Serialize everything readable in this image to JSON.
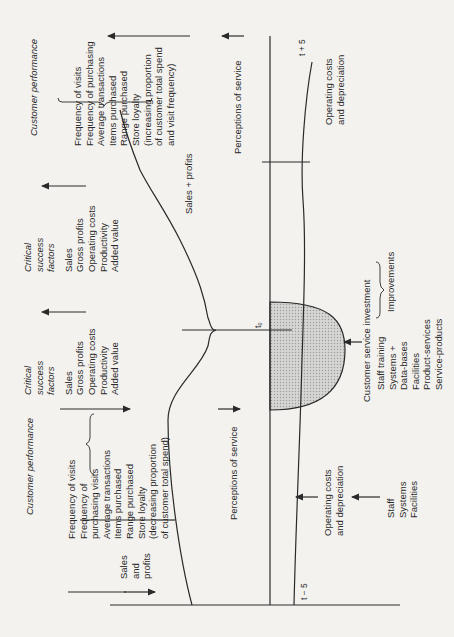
{
  "diagram": {
    "orientation": "rotated-90-ccw",
    "colors": {
      "ink": "#2a2a2a",
      "paper": "#f3f2ee",
      "shade": "#c9c9c9"
    },
    "left_customer_performance": {
      "heading": "Customer performance",
      "items": [
        "Frequency of visits",
        "Frequency of",
        "purchasing visits",
        "Average transactions",
        "Items purchased",
        "Range purchased",
        "Store loyalty",
        "(decreasing proportion",
        "of customer total spend)"
      ],
      "brace_label": [
        "Sales",
        "and",
        "profits"
      ]
    },
    "left_critical_success": {
      "heading": [
        "Critical",
        "success",
        "factors"
      ],
      "items": [
        "Sales",
        "Gross profits",
        "Operating costs",
        "Productivity",
        "Added value"
      ]
    },
    "right_critical_success": {
      "heading": [
        "Critical",
        "success",
        "factors"
      ],
      "items": [
        "Sales",
        "Gross profits",
        "Operating costs",
        "Productivity",
        "Added value"
      ]
    },
    "right_customer_performance": {
      "heading": "Customer performance",
      "items": [
        "Frequency of visits",
        "Frequency of purchasing",
        "Average transactions",
        "Items purchased",
        "Range purchased",
        "Store loyalty",
        "(increasing proportion",
        "of customer total spend",
        "and visit frequency)"
      ]
    },
    "sales_profits_label": "Sales + profits",
    "perceptions_left": "Perceptions of service",
    "perceptions_right": "Perceptions of service",
    "t0_label": "t₀",
    "t_minus_label": "t − 5",
    "t_plus_label": "t + 5",
    "operating_costs_left": [
      "Operating costs",
      "and depreciation"
    ],
    "operating_costs_right": [
      "Operating costs",
      "and depreciation"
    ],
    "staff_systems": [
      "Staff",
      "Systems",
      "Facilities"
    ],
    "customer_service_investment": "Customer service investment",
    "improvements": {
      "items": [
        "Staff training",
        "Systems +",
        "Data-bases",
        "Facilities",
        "Product-services",
        "Service-products"
      ],
      "label": "Improvements"
    }
  }
}
